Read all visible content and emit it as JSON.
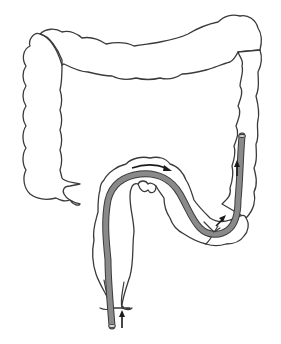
{
  "diagram": {
    "elements": [
      {
        "name": "transverse-colon"
      },
      {
        "name": "ascending-colon"
      },
      {
        "name": "cecum"
      },
      {
        "name": "descending-colon"
      },
      {
        "name": "sigmoid-colon"
      },
      {
        "name": "rectum"
      },
      {
        "name": "endoscope"
      },
      {
        "name": "insertion-arrow"
      },
      {
        "name": "sigmoid-arrow"
      },
      {
        "name": "descending-arrow"
      }
    ],
    "colors": {
      "outline": "#3a3a3a",
      "scope_fill": "#8a8a8a",
      "arrow": "#1a1a1a",
      "background": "#ffffff"
    }
  }
}
